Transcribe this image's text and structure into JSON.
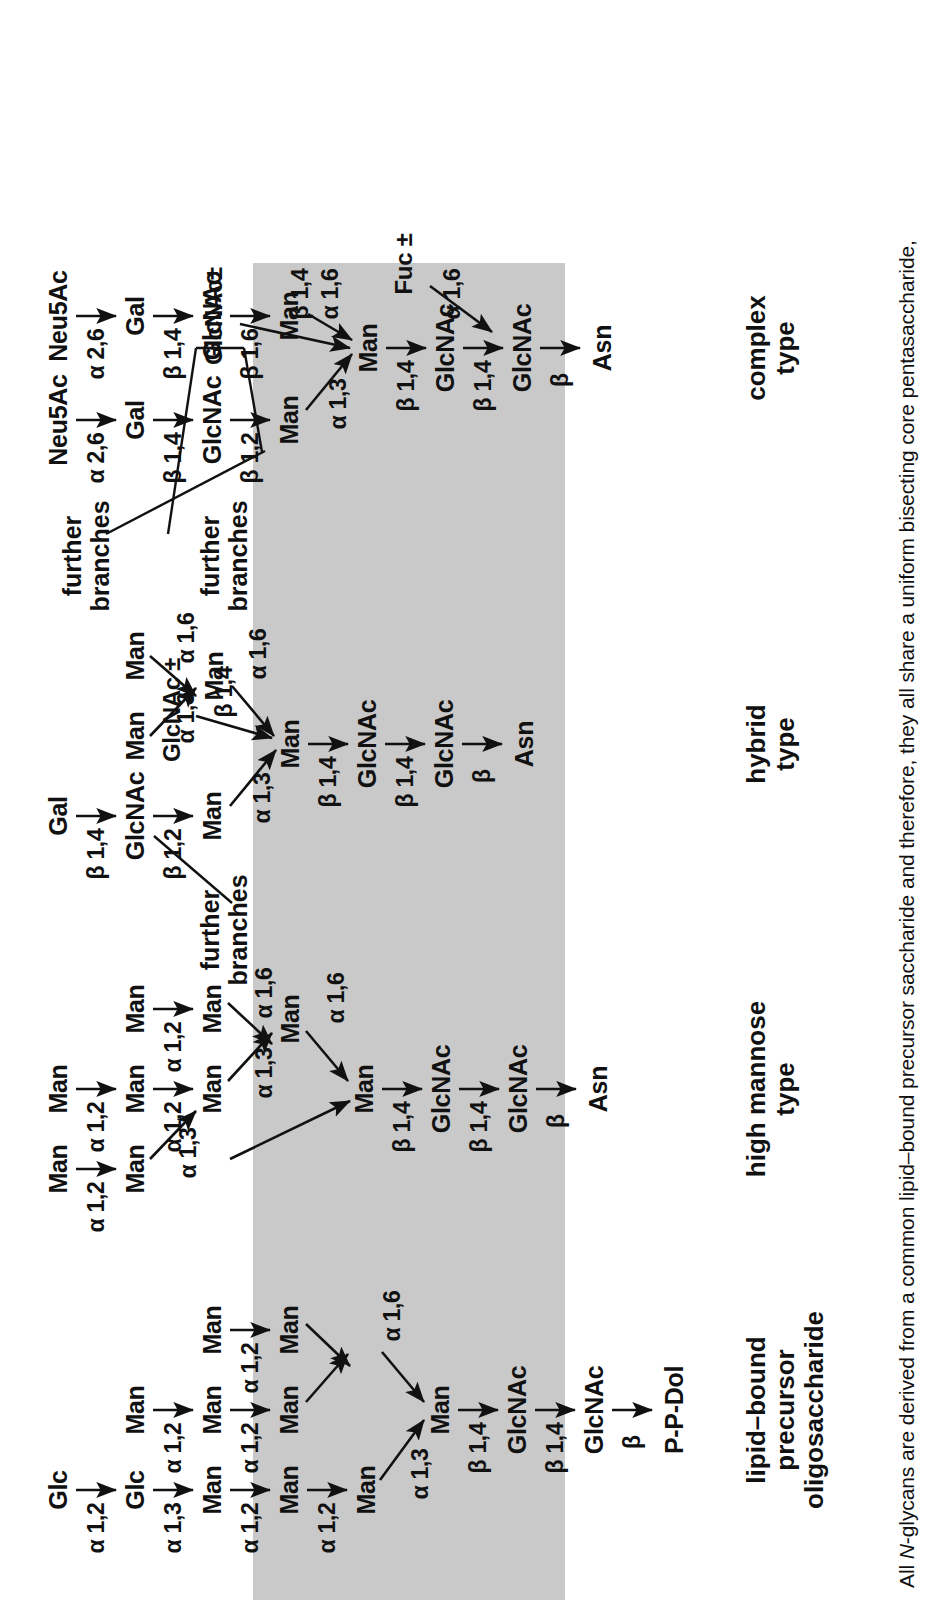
{
  "figure": {
    "caption": "All N-glycans are derived from a common lipid–bound precursor saccharide and therefore, they all share a uniform bisecting core pentasaccharide,",
    "caption_italic_token": "N",
    "core_band_color": "#c9c9c9",
    "ink_color": "#111111"
  },
  "groups": [
    {
      "id": "precursor",
      "line1": "lipid–bound",
      "line2": "precursor",
      "line3": "oligosaccharide"
    },
    {
      "id": "high-mannose",
      "line1": "high mannose",
      "line2": "type",
      "line3": ""
    },
    {
      "id": "hybrid",
      "line1": "hybrid",
      "line2": "type",
      "line3": ""
    },
    {
      "id": "complex",
      "line1": "complex",
      "line2": "type",
      "line3": ""
    }
  ],
  "residues": {
    "glc": "Glc",
    "man": "Man",
    "gal": "Gal",
    "glcnac": "GlcNAc",
    "neu5ac": "Neu5Ac",
    "asn": "Asn",
    "ppdol": "P-P-Dol",
    "fuc_pm": "Fuc ±",
    "glcnac_pm": "GlcNAc±",
    "glcnac_pm_spaced": "GlcNAc ±",
    "further_branches_l1": "further",
    "further_branches_l2": "branches"
  },
  "linkages": {
    "a12": "α 1,2",
    "a13": "α 1,3",
    "a16": "α 1,6",
    "a26": "α 2,6",
    "b12": "β 1,2",
    "b14": "β 1,4",
    "b16": "β 1,6",
    "b": "β"
  },
  "precursor_panel": {
    "name": "lipid-bound precursor oligosaccharide",
    "chain_top": [
      "Glc",
      "Glc",
      "Man",
      "Man",
      "Man"
    ],
    "chain_top_links": [
      "α 1,2",
      "α 1,3",
      "α 1,2",
      "α 1,2"
    ],
    "branch_b": [
      "Man",
      "Man",
      "Man"
    ],
    "branch_b_links": [
      "α 1,2",
      "α 1,2"
    ],
    "branch_c": [
      "Man",
      "Man"
    ],
    "branch_c_links": [
      "α 1,2"
    ],
    "core": [
      "Man",
      "Man",
      "GlcNAc",
      "GlcNAc",
      "P-P-Dol"
    ],
    "core_links": [
      "α 1,3",
      "α 1,6",
      "β 1,4",
      "β 1,4",
      "β"
    ]
  },
  "high_mannose_panel": {
    "name": "high mannose type",
    "branches": [
      {
        "outer": [
          "Man",
          "Man"
        ],
        "links": [
          "α 1,2"
        ],
        "to_core": "α 1,3"
      },
      {
        "outer": [
          "Man",
          "Man",
          "Man"
        ],
        "links": [
          "α 1,2",
          "α 1,2"
        ],
        "to_core": "α 1,3"
      },
      {
        "outer": [
          "Man",
          "Man"
        ],
        "links": [
          "α 1,2"
        ],
        "to_core": "α 1,6"
      }
    ],
    "core": [
      "Man",
      "Man",
      "GlcNAc",
      "GlcNAc",
      "Asn"
    ],
    "core_links": [
      "α 1,6",
      "β 1,4",
      "β 1,4",
      "β"
    ]
  },
  "hybrid_panel": {
    "name": "hybrid type",
    "antenna": [
      "Gal",
      "GlcNAc",
      "Man"
    ],
    "antenna_links": [
      "β 1,4",
      "β 1,2"
    ],
    "antenna_to_core": "α 1,3",
    "mannose_arm": [
      "Man",
      "Man"
    ],
    "mannose_arm_links": [
      "α 1,3",
      "α 1,6"
    ],
    "mannose_arm_to_core": "α 1,6",
    "bisecting": "GlcNAc ±",
    "bisecting_link": "β 1,4",
    "core": [
      "Man",
      "GlcNAc",
      "GlcNAc",
      "Asn"
    ],
    "core_links": [
      "β 1,4",
      "β 1,4",
      "β"
    ],
    "further_branches": "further branches"
  },
  "complex_panel": {
    "name": "complex type",
    "antenna_a": [
      "Neu5Ac",
      "Gal",
      "GlcNAc",
      "Man"
    ],
    "antenna_a_links": [
      "α 2,6",
      "β 1,4",
      "β 1,2"
    ],
    "antenna_a_to_core": "α 1,3",
    "antenna_b": [
      "Neu5Ac",
      "Gal",
      "GlcNAc",
      "Man"
    ],
    "antenna_b_links": [
      "α 2,6",
      "β 1,4",
      "β 1,6"
    ],
    "antenna_b_to_core": "α 1,6",
    "bisecting": "GlcNAc±",
    "bisecting_link": "β 1,4",
    "fucose": "Fuc ±",
    "fucose_link": "α 1,6",
    "core": [
      "Man",
      "GlcNAc",
      "GlcNAc",
      "Asn"
    ],
    "core_links": [
      "β 1,4",
      "β 1,4",
      "β"
    ],
    "further_branches": "further branches"
  }
}
